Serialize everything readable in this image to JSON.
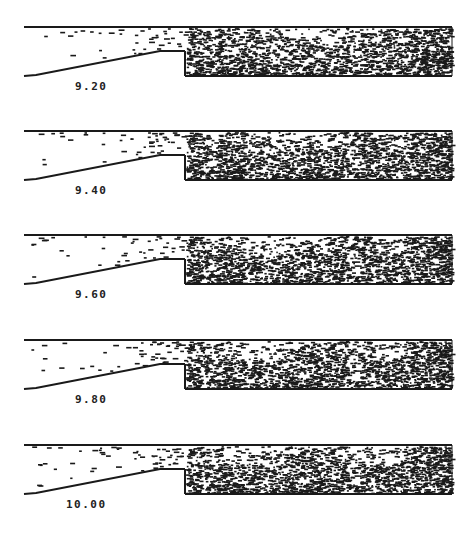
{
  "figure": {
    "panels": [
      {
        "time_label": "9.20",
        "top": 0
      },
      {
        "time_label": "9.40",
        "top": 104
      },
      {
        "time_label": "9.60",
        "top": 208
      },
      {
        "time_label": "9.80",
        "top": 313
      },
      {
        "time_label": "10.00",
        "top": 418
      }
    ],
    "colors": {
      "ink": "#1a1a1a",
      "background": "#ffffff"
    }
  }
}
